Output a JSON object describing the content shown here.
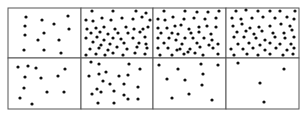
{
  "figure": {
    "rows": 2,
    "cols": 4,
    "grid": {
      "left": 8,
      "top": 8,
      "right": 299,
      "bottom": 109,
      "col_edges": [
        8,
        81,
        153,
        226,
        299
      ],
      "row_edges": [
        8,
        58,
        109
      ]
    },
    "line_color": "#555555",
    "dot_color": "#111111",
    "dot_radius": 1.6,
    "panels": [
      {
        "id": "panel-1",
        "row": 0,
        "col": 0,
        "dots": [
          [
            26,
            17
          ],
          [
            42,
            20
          ],
          [
            68,
            16
          ],
          [
            54,
            24
          ],
          [
            25,
            26
          ],
          [
            69,
            29
          ],
          [
            44,
            33
          ],
          [
            25,
            35
          ],
          [
            38,
            40
          ],
          [
            59,
            40
          ],
          [
            24,
            50
          ],
          [
            44,
            50
          ],
          [
            61,
            53
          ]
        ]
      },
      {
        "id": "panel-2",
        "row": 0,
        "col": 1,
        "dots": [
          [
            92,
            11
          ],
          [
            113,
            11
          ],
          [
            136,
            11
          ],
          [
            146,
            13
          ],
          [
            86,
            20
          ],
          [
            93,
            21
          ],
          [
            102,
            18
          ],
          [
            111,
            20
          ],
          [
            122,
            18
          ],
          [
            133,
            19
          ],
          [
            142,
            17
          ],
          [
            150,
            20
          ],
          [
            87,
            29
          ],
          [
            96,
            28
          ],
          [
            104,
            27
          ],
          [
            115,
            29
          ],
          [
            126,
            27
          ],
          [
            134,
            29
          ],
          [
            143,
            29
          ],
          [
            148,
            27
          ],
          [
            91,
            33
          ],
          [
            100,
            32
          ],
          [
            108,
            34
          ],
          [
            118,
            33
          ],
          [
            128,
            33
          ],
          [
            140,
            32
          ],
          [
            86,
            38
          ],
          [
            97,
            37
          ],
          [
            104,
            40
          ],
          [
            113,
            38
          ],
          [
            121,
            39
          ],
          [
            133,
            38
          ],
          [
            145,
            37
          ],
          [
            93,
            42
          ],
          [
            101,
            45
          ],
          [
            110,
            44
          ],
          [
            124,
            43
          ],
          [
            139,
            43
          ],
          [
            146,
            44
          ],
          [
            90,
            49
          ],
          [
            99,
            48
          ],
          [
            108,
            50
          ],
          [
            117,
            47
          ],
          [
            127,
            49
          ],
          [
            137,
            47
          ],
          [
            147,
            48
          ],
          [
            86,
            55
          ],
          [
            96,
            54
          ],
          [
            113,
            53
          ],
          [
            123,
            55
          ],
          [
            135,
            53
          ],
          [
            145,
            54
          ],
          [
            105,
            55
          ]
        ]
      },
      {
        "id": "panel-3",
        "row": 0,
        "col": 2,
        "dots": [
          [
            164,
            11
          ],
          [
            185,
            11
          ],
          [
            197,
            12
          ],
          [
            208,
            12
          ],
          [
            219,
            11
          ],
          [
            158,
            19
          ],
          [
            165,
            20
          ],
          [
            173,
            17
          ],
          [
            184,
            19
          ],
          [
            194,
            18
          ],
          [
            205,
            19
          ],
          [
            216,
            18
          ],
          [
            158,
            28
          ],
          [
            167,
            28
          ],
          [
            175,
            26
          ],
          [
            181,
            25
          ],
          [
            189,
            29
          ],
          [
            199,
            27
          ],
          [
            207,
            26
          ],
          [
            216,
            27
          ],
          [
            161,
            33
          ],
          [
            172,
            33
          ],
          [
            178,
            34
          ],
          [
            191,
            33
          ],
          [
            199,
            32
          ],
          [
            211,
            34
          ],
          [
            158,
            38
          ],
          [
            169,
            38
          ],
          [
            176,
            40
          ],
          [
            185,
            38
          ],
          [
            193,
            38
          ],
          [
            204,
            38
          ],
          [
            212,
            40
          ],
          [
            164,
            43
          ],
          [
            182,
            44
          ],
          [
            197,
            43
          ],
          [
            209,
            45
          ],
          [
            218,
            44
          ],
          [
            158,
            48
          ],
          [
            168,
            48
          ],
          [
            177,
            50
          ],
          [
            190,
            49
          ],
          [
            200,
            47
          ],
          [
            213,
            48
          ],
          [
            160,
            55
          ],
          [
            172,
            55
          ],
          [
            184,
            54
          ],
          [
            195,
            53
          ],
          [
            203,
            55
          ],
          [
            218,
            54
          ],
          [
            180,
            49
          ],
          [
            188,
            52
          ]
        ]
      },
      {
        "id": "panel-4",
        "row": 0,
        "col": 3,
        "dots": [
          [
            236,
            11
          ],
          [
            246,
            10
          ],
          [
            258,
            11
          ],
          [
            270,
            11
          ],
          [
            280,
            11
          ],
          [
            295,
            11
          ],
          [
            232,
            18
          ],
          [
            241,
            19
          ],
          [
            252,
            18
          ],
          [
            263,
            17
          ],
          [
            275,
            18
          ],
          [
            287,
            17
          ],
          [
            294,
            19
          ],
          [
            233,
            26
          ],
          [
            242,
            24
          ],
          [
            250,
            28
          ],
          [
            259,
            27
          ],
          [
            270,
            26
          ],
          [
            281,
            24
          ],
          [
            290,
            26
          ],
          [
            237,
            32
          ],
          [
            246,
            31
          ],
          [
            254,
            34
          ],
          [
            262,
            31
          ],
          [
            273,
            33
          ],
          [
            284,
            33
          ],
          [
            292,
            30
          ],
          [
            234,
            37
          ],
          [
            244,
            37
          ],
          [
            256,
            38
          ],
          [
            265,
            40
          ],
          [
            275,
            37
          ],
          [
            285,
            38
          ],
          [
            294,
            37
          ],
          [
            238,
            44
          ],
          [
            249,
            43
          ],
          [
            260,
            45
          ],
          [
            270,
            43
          ],
          [
            280,
            44
          ],
          [
            291,
            44
          ],
          [
            231,
            49
          ],
          [
            243,
            49
          ],
          [
            253,
            48
          ],
          [
            265,
            50
          ],
          [
            276,
            48
          ],
          [
            287,
            50
          ],
          [
            294,
            48
          ],
          [
            234,
            55
          ],
          [
            247,
            54
          ],
          [
            258,
            55
          ],
          [
            270,
            54
          ],
          [
            283,
            55
          ],
          [
            293,
            54
          ]
        ]
      },
      {
        "id": "panel-5",
        "row": 1,
        "col": 0,
        "dots": [
          [
            18,
            67
          ],
          [
            28,
            66
          ],
          [
            36,
            68
          ],
          [
            65,
            69
          ],
          [
            25,
            77
          ],
          [
            41,
            78
          ],
          [
            58,
            76
          ],
          [
            24,
            88
          ],
          [
            47,
            92
          ],
          [
            64,
            92
          ],
          [
            20,
            98
          ],
          [
            32,
            104
          ]
        ]
      },
      {
        "id": "panel-6",
        "row": 1,
        "col": 1,
        "dots": [
          [
            99,
            64
          ],
          [
            129,
            64
          ],
          [
            140,
            69
          ],
          [
            89,
            76
          ],
          [
            99,
            74
          ],
          [
            106,
            72
          ],
          [
            119,
            76
          ],
          [
            128,
            75
          ],
          [
            103,
            81
          ],
          [
            110,
            84
          ],
          [
            124,
            84
          ],
          [
            138,
            87
          ],
          [
            97,
            89
          ],
          [
            92,
            94
          ],
          [
            101,
            92
          ],
          [
            114,
            91
          ],
          [
            124,
            95
          ],
          [
            128,
            99
          ],
          [
            138,
            99
          ],
          [
            98,
            103
          ],
          [
            114,
            103
          ],
          [
            91,
            62
          ]
        ]
      },
      {
        "id": "panel-7",
        "row": 1,
        "col": 2,
        "dots": [
          [
            159,
            65
          ],
          [
            178,
            69
          ],
          [
            201,
            64
          ],
          [
            218,
            65
          ],
          [
            203,
            74
          ],
          [
            167,
            79
          ],
          [
            185,
            80
          ],
          [
            202,
            85
          ],
          [
            172,
            98
          ],
          [
            189,
            94
          ],
          [
            212,
            100
          ]
        ]
      },
      {
        "id": "panel-8",
        "row": 1,
        "col": 3,
        "dots": [
          [
            238,
            63
          ],
          [
            284,
            69
          ],
          [
            260,
            83
          ],
          [
            264,
            102
          ]
        ]
      }
    ]
  }
}
